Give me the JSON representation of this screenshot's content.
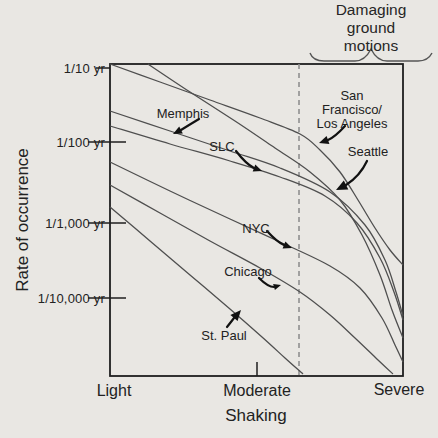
{
  "figure": {
    "background": "#e9e7e3",
    "annotation": {
      "line1": "Damaging",
      "line2": "ground motions"
    },
    "y_axis": {
      "title": "Rate of occurrence",
      "ticks": [
        "1/10 yr",
        "1/100 yr",
        "1/1,000 yr",
        "1/10,000 yr"
      ]
    },
    "x_axis": {
      "title": "Shaking",
      "ticks": [
        "Light",
        "Moderate",
        "Severe"
      ]
    },
    "colors": {
      "curve": "#4f4f4f",
      "box": "#1f1f1f",
      "dashed_line": "#8f8f8f",
      "text": "#222222",
      "arrow": "#111111"
    },
    "arrows": [
      {
        "for": "Memphis",
        "d": "M199,119 Q189,125 181,130",
        "end": [
          181,
          130
        ],
        "tip": [
          173,
          134
        ]
      },
      {
        "for": "SLC",
        "d": "M236,151 Q246,164 254,168",
        "end": [
          254,
          168
        ],
        "tip": [
          262,
          171
        ]
      },
      {
        "for": "San Francisco/Los Angeles",
        "d": "M345,126 Q335,137 328,140",
        "end": [
          328,
          140
        ],
        "tip": [
          319,
          143
        ]
      },
      {
        "for": "Seattle",
        "d": "M367,161 Q360,176 346,185",
        "end": [
          346,
          185
        ],
        "tip": [
          336,
          190
        ]
      },
      {
        "for": "NYC",
        "d": "M267,231 Q277,242 284,245",
        "end": [
          284,
          245
        ],
        "tip": [
          292,
          248
        ]
      },
      {
        "for": "Chicago",
        "d": "M259,278 Q268,287 274,287",
        "end": [
          274,
          287
        ],
        "tip": [
          281,
          285
        ]
      },
      {
        "for": "St. Paul",
        "d": "M227,327 Q231,322 234,318",
        "end": [
          234,
          318
        ],
        "tip": [
          241,
          310
        ]
      }
    ]
  },
  "chart_data": {
    "type": "line",
    "title": "",
    "xlabel": "Shaking",
    "ylabel": "Rate of occurrence",
    "x_tick_labels": [
      "Light",
      "Moderate",
      "Severe"
    ],
    "y_tick_labels": [
      "1/10 yr",
      "1/100 yr",
      "1/1,000 yr",
      "1/10,000 yr"
    ],
    "grid": false,
    "legend": "labels with arrows inside plot",
    "axes_note": "qualitative x axis (shaking intensity), logarithmic-style qualitative y axis (annual rate of occurrence, decreasing downward)",
    "plot_box_px": {
      "left": 110,
      "right": 403,
      "top": 64,
      "bottom": 376
    },
    "axis_px_map": {
      "x": {
        "Light": 110,
        "Moderate": 257,
        "Severe": 403
      },
      "y": {
        "1/10 yr": 68,
        "1/100 yr": 142,
        "1/1,000 yr": 223,
        "1/10,000 yr": 298
      }
    },
    "threshold": {
      "label": "Damaging ground motions",
      "style": "dashed vertical line",
      "x_px": 299,
      "brace_span_px": [
        310,
        432
      ]
    },
    "series": [
      {
        "name": "San Francisco/Los Angeles",
        "label_line1": "San Francisco/",
        "label_line2": "Los Angeles",
        "label_px": [
          352,
          110
        ],
        "points_px": [
          [
            110,
            64
          ],
          [
            160,
            82
          ],
          [
            210,
            100
          ],
          [
            260,
            118
          ],
          [
            300,
            134
          ],
          [
            320,
            150
          ],
          [
            340,
            172
          ],
          [
            358,
            200
          ],
          [
            375,
            228
          ],
          [
            390,
            250
          ],
          [
            403,
            265
          ]
        ]
      },
      {
        "name": "Seattle",
        "label": "Seattle",
        "label_px": [
          368,
          152
        ],
        "points_px": [
          [
            148,
            64
          ],
          [
            190,
            92
          ],
          [
            235,
            121
          ],
          [
            275,
            148
          ],
          [
            310,
            172
          ],
          [
            340,
            200
          ],
          [
            362,
            235
          ],
          [
            380,
            275
          ],
          [
            392,
            310
          ],
          [
            403,
            338
          ]
        ]
      },
      {
        "name": "Memphis",
        "label": "Memphis",
        "label_px": [
          183,
          114
        ],
        "points_px": [
          [
            110,
            111
          ],
          [
            170,
            131
          ],
          [
            230,
            151
          ],
          [
            280,
            168
          ],
          [
            330,
            192
          ],
          [
            365,
            225
          ],
          [
            385,
            260
          ],
          [
            396,
            292
          ],
          [
            403,
            316
          ]
        ]
      },
      {
        "name": "SLC",
        "label": "SLC",
        "label_px": [
          222,
          147
        ],
        "points_px": [
          [
            110,
            126
          ],
          [
            170,
            144
          ],
          [
            230,
            161
          ],
          [
            280,
            177
          ],
          [
            325,
            196
          ],
          [
            357,
            223
          ],
          [
            380,
            258
          ],
          [
            394,
            292
          ],
          [
            403,
            320
          ]
        ]
      },
      {
        "name": "NYC",
        "label": "NYC",
        "label_px": [
          256,
          229
        ],
        "points_px": [
          [
            110,
            162
          ],
          [
            170,
            191
          ],
          [
            230,
            219
          ],
          [
            280,
            242
          ],
          [
            330,
            266
          ],
          [
            360,
            288
          ],
          [
            382,
            318
          ],
          [
            395,
            345
          ],
          [
            403,
            362
          ]
        ]
      },
      {
        "name": "Chicago",
        "label": "Chicago",
        "label_px": [
          248,
          272
        ],
        "points_px": [
          [
            110,
            185
          ],
          [
            160,
            213
          ],
          [
            210,
            241
          ],
          [
            260,
            268
          ],
          [
            300,
            292
          ],
          [
            330,
            315
          ],
          [
            355,
            338
          ],
          [
            378,
            360
          ],
          [
            393,
            374
          ]
        ]
      },
      {
        "name": "St. Paul",
        "label": "St. Paul",
        "label_px": [
          224,
          336
        ],
        "points_px": [
          [
            110,
            207
          ],
          [
            150,
            241
          ],
          [
            190,
            275
          ],
          [
            230,
            309
          ],
          [
            262,
            337
          ],
          [
            285,
            358
          ],
          [
            303,
            374
          ]
        ]
      }
    ]
  }
}
